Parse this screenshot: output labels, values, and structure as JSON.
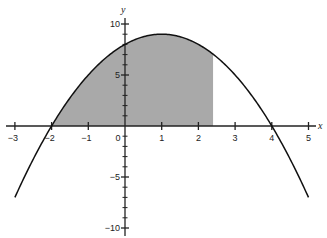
{
  "chart_data": {
    "type": "line",
    "title": "",
    "xlabel": "x",
    "ylabel": "y",
    "function": "y = -x^2 + 2x + 8",
    "roots": [
      -2,
      4
    ],
    "vertex": [
      1,
      9
    ],
    "x_range": [
      -3,
      5
    ],
    "xlim": [
      -3.3,
      5.4
    ],
    "ylim": [
      -10.5,
      10.8
    ],
    "x_ticks": [
      -3,
      -2,
      -1,
      0,
      1,
      2,
      3,
      4,
      5
    ],
    "x_tick_labels": [
      "−3",
      "−2",
      "−1",
      "0",
      "1",
      "2",
      "3",
      "4",
      "5"
    ],
    "y_ticks_labeled": [
      10,
      5,
      -5,
      -10
    ],
    "y_tick_labels": [
      "10",
      "5",
      "−5",
      "−10"
    ],
    "y_minor_step": 1,
    "shaded_region": {
      "x_from": -2,
      "x_to": 2.4,
      "between": "curve and x-axis",
      "color": "#a9a9a9"
    },
    "series": [
      {
        "name": "parabola",
        "x": [
          -3,
          -2,
          -1,
          0,
          1,
          2,
          3,
          4,
          5
        ],
        "values": [
          -7,
          0,
          5,
          8,
          9,
          8,
          5,
          0,
          -7
        ]
      }
    ],
    "grid": false,
    "legend": null
  },
  "labels": {
    "x_axis": "x",
    "y_axis": "y",
    "origin": "0"
  },
  "colors": {
    "curve": "#111111",
    "axis": "#222222",
    "shade": "#a9a9a9"
  }
}
